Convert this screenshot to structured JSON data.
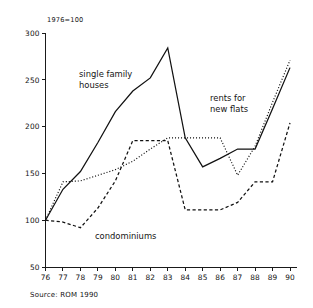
{
  "chart_data": {
    "type": "line",
    "title": "",
    "subtitle": "",
    "unit_note": "1976=100",
    "xlabel": "",
    "ylabel": "",
    "categories": [
      "76",
      "77",
      "78",
      "79",
      "80",
      "81",
      "82",
      "83",
      "84",
      "85",
      "86",
      "87",
      "88",
      "89",
      "90"
    ],
    "x": [
      1976,
      1977,
      1978,
      1979,
      1980,
      1981,
      1982,
      1983,
      1984,
      1985,
      1986,
      1987,
      1988,
      1989,
      1990
    ],
    "xlim": [
      1976,
      1990
    ],
    "ylim": [
      50,
      300
    ],
    "yticks": [
      50,
      100,
      150,
      200,
      250,
      300
    ],
    "xticks": [
      "76",
      "77",
      "78",
      "79",
      "80",
      "81",
      "82",
      "83",
      "84",
      "85",
      "86",
      "87",
      "88",
      "89",
      "90"
    ],
    "grid": false,
    "legend": "inline-annotations",
    "series": [
      {
        "name": "single family houses",
        "style": "solid",
        "values": [
          100,
          133,
          152,
          183,
          216,
          238,
          252,
          284,
          188,
          157,
          166,
          176,
          176,
          219,
          263
        ]
      },
      {
        "name": "condominiums",
        "style": "dashed",
        "values": [
          100,
          98,
          92,
          113,
          142,
          185,
          185,
          185,
          111,
          111,
          111,
          119,
          141,
          141,
          204
        ]
      },
      {
        "name": "rents for new flats",
        "style": "dotted",
        "values": [
          100,
          141,
          142,
          148,
          154,
          163,
          176,
          188,
          188,
          188,
          188,
          148,
          179,
          226,
          271
        ]
      }
    ],
    "annotations": [
      {
        "text_line1": "single family",
        "text_line2": "houses",
        "for_series": "single family houses"
      },
      {
        "text_line1": "rents for",
        "text_line2": "new flats",
        "for_series": "rents for new flats"
      },
      {
        "text_line1": "condominiums",
        "text_line2": "",
        "for_series": "condominiums"
      }
    ],
    "source": "Source: ROM 1990",
    "colors": {
      "ink": "#111111",
      "background": "#ffffff"
    }
  }
}
